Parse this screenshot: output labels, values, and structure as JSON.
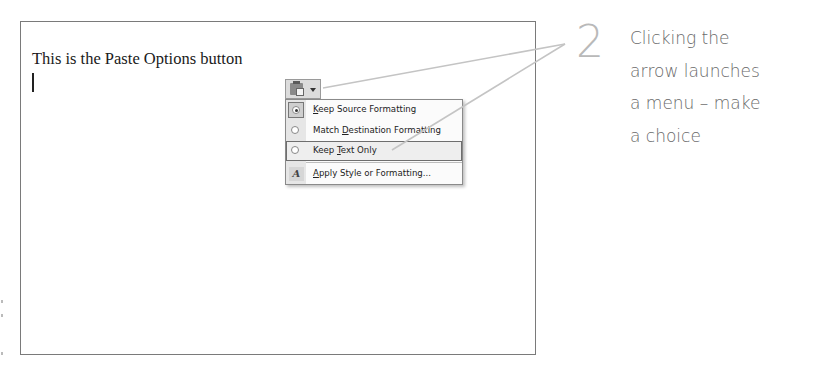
{
  "document": {
    "text": "This is the Paste Options button"
  },
  "paste_options": {
    "button_icon": "clipboard-paste-icon",
    "dropdown_icon": "dropdown-arrow-icon",
    "menu": {
      "items": [
        {
          "label_prefix": "",
          "accel": "K",
          "label_suffix": "eep Source Formatting",
          "full_label": "Keep Source Formatting",
          "icon": "radio-checked-icon",
          "selected": true,
          "highlighted": false
        },
        {
          "label_prefix": "Match ",
          "accel": "D",
          "label_suffix": "estination Formatting",
          "full_label": "Match Destination Formatting",
          "icon": "radio-icon",
          "selected": false,
          "highlighted": false
        },
        {
          "label_prefix": "Keep ",
          "accel": "T",
          "label_suffix": "ext Only",
          "full_label": "Keep Text Only",
          "icon": "radio-icon",
          "selected": false,
          "highlighted": true
        },
        {
          "label_prefix": "",
          "accel": "A",
          "label_suffix": "pply Style or Formatting...",
          "full_label": "Apply Style or Formatting...",
          "icon": "style-formatting-icon",
          "selected": false,
          "highlighted": false
        }
      ]
    }
  },
  "callout": {
    "step_number": "2",
    "lines": [
      "Clicking the",
      "arrow launches",
      "a menu – make",
      "a choice"
    ],
    "line_color": "#c8c8c8",
    "number_color": "#b9b9b9",
    "text_color": "#6a6a6a"
  }
}
